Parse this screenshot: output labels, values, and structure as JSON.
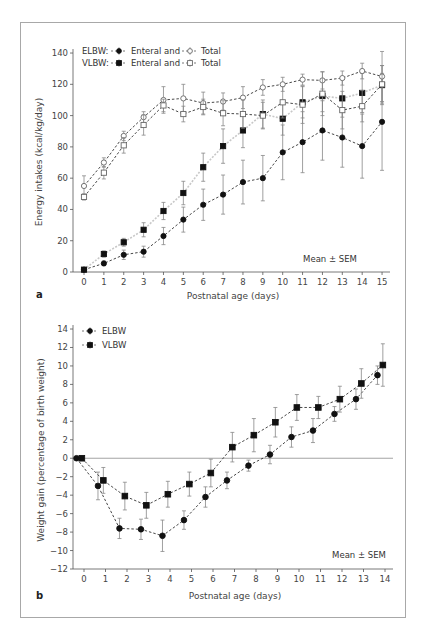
{
  "chart_data": [
    {
      "panel": "a",
      "type": "line",
      "title": "",
      "xlabel": "Postnatal age (days)",
      "ylabel": "Energy intakes (kcal/kg/day)",
      "x": [
        0,
        1,
        2,
        3,
        4,
        5,
        6,
        7,
        8,
        9,
        10,
        11,
        12,
        13,
        14,
        15
      ],
      "x_ticks": [
        "0",
        "1",
        "2",
        "3",
        "4",
        "5",
        "6",
        "7",
        "8",
        "9",
        "10",
        "11",
        "12",
        "13",
        "14",
        "15"
      ],
      "y_ticks": [
        "0",
        "20",
        "40",
        "60",
        "80",
        "100",
        "120",
        "140"
      ],
      "ylim": [
        0,
        140
      ],
      "grid": false,
      "annotation": "Mean ± SEM",
      "legend": {
        "position": "upper-left",
        "rows": [
          {
            "group": "ELBW:",
            "enteral": "Enteral and",
            "total": "Total"
          },
          {
            "group": "VLBW:",
            "enteral": "Enteral and",
            "total": "Total"
          }
        ]
      },
      "series": [
        {
          "name": "ELBW Enteral",
          "marker": "filled-circle",
          "values": [
            1.5,
            5.5,
            11,
            13,
            23,
            33.5,
            43,
            49.5,
            57.5,
            60,
            76.5,
            83,
            90.5,
            86,
            80.5,
            96
          ],
          "sem": [
            1,
            1.5,
            3,
            3.5,
            5.5,
            8,
            10,
            12.5,
            14,
            14.5,
            17.5,
            19.5,
            19,
            19,
            20.5,
            31
          ]
        },
        {
          "name": "VLBW Enteral",
          "marker": "filled-square",
          "values": [
            1.5,
            11.5,
            19,
            27,
            39,
            50.5,
            67,
            80.5,
            90.5,
            101,
            98,
            108.5,
            112.5,
            111,
            114.5,
            119.5
          ],
          "sem": [
            0.5,
            2,
            2.5,
            4.5,
            5.5,
            7.5,
            9,
            11,
            11,
            9,
            10.5,
            10,
            10,
            12,
            12.5,
            12.5
          ]
        },
        {
          "name": "ELBW Total",
          "marker": "open-circle",
          "values": [
            55,
            70,
            87,
            99,
            110,
            111,
            108,
            109,
            111.5,
            118,
            120,
            123,
            122.5,
            124,
            128.5,
            125
          ],
          "sem": [
            6.5,
            3,
            3,
            3.5,
            8.5,
            9,
            7,
            5.5,
            7,
            5,
            4.5,
            3.5,
            5.5,
            4.5,
            5,
            16
          ]
        },
        {
          "name": "VLBW Total",
          "marker": "open-square",
          "values": [
            48,
            63.5,
            81,
            94,
            106.5,
            101,
            105.5,
            101.5,
            101,
            100,
            108.5,
            107,
            114,
            103.5,
            106,
            120
          ],
          "sem": [
            2,
            4,
            5,
            6.5,
            4,
            5,
            5,
            8,
            9,
            8.5,
            10,
            12,
            14,
            12,
            10,
            12
          ]
        }
      ]
    },
    {
      "panel": "b",
      "type": "line",
      "title": "",
      "xlabel": "Postnatal age (days)",
      "ylabel": "Weight gain (percentage of birth weight)",
      "x": [
        0,
        1,
        2,
        3,
        4,
        5,
        6,
        7,
        8,
        9,
        10,
        11,
        12,
        13,
        14
      ],
      "x_ticks": [
        "0",
        "1",
        "2",
        "3",
        "4",
        "5",
        "6",
        "7",
        "8",
        "9",
        "10",
        "11",
        "12",
        "13",
        "14"
      ],
      "y_ticks": [
        "14",
        "12",
        "10",
        "8",
        "6",
        "4",
        "2",
        "0",
        "-2",
        "-4",
        "-6",
        "-8",
        "-10",
        "-12"
      ],
      "ylim": [
        -12,
        14
      ],
      "grid": false,
      "reference_line_y": 0,
      "annotation": "Mean ± SEM",
      "legend": {
        "position": "upper-left",
        "entries": [
          "ELBW",
          "VLBW"
        ]
      },
      "series": [
        {
          "name": "ELBW",
          "marker": "filled-circle",
          "x_offset": -0.35,
          "values": [
            0,
            -3,
            -7.6,
            -7.7,
            -8.4,
            -6.7,
            -4.2,
            -2.4,
            -0.8,
            0.4,
            2.3,
            3,
            4.8,
            6.4,
            9
          ],
          "sem": [
            0,
            1.5,
            1.1,
            1.1,
            1.7,
            1,
            1.1,
            0.9,
            0.6,
            1,
            1.1,
            1.3,
            0.8,
            1.1,
            1
          ]
        },
        {
          "name": "VLBW",
          "marker": "filled-square",
          "x_offset": -0.1,
          "values": [
            0,
            -2.4,
            -4.1,
            -5.1,
            -3.9,
            -2.8,
            -1.6,
            1.2,
            2.5,
            3.9,
            5.5,
            5.5,
            6.4,
            8.1,
            10.1
          ],
          "sem": [
            0,
            1.4,
            1.5,
            1.4,
            1.4,
            1.3,
            1.5,
            1.6,
            1.8,
            1.6,
            1.4,
            1.2,
            1.4,
            1.6,
            2.3
          ]
        }
      ]
    }
  ],
  "panels": {
    "a": {
      "label": "a",
      "ylabel": "Energy intakes (kcal/kg/day)",
      "xlabel": "Postnatal age (days)",
      "annotation": "Mean ± SEM",
      "legend_row1_group": "ELBW:",
      "legend_row2_group": "VLBW:",
      "legend_enteral": "Enteral and",
      "legend_total": "Total"
    },
    "b": {
      "label": "b",
      "ylabel": "Weight gain (percentage of birth weight)",
      "xlabel": "Postnatal age (days)",
      "annotation": "Mean ± SEM",
      "legend_elbw": "ELBW",
      "legend_vlbw": "VLBW"
    }
  },
  "colors": {
    "axis": "#555555",
    "marker": "#111111",
    "error_bar": "#888888",
    "dashed_line": "#333333",
    "vlbw_enteral_line": "#c8c8c8",
    "frame": "#a8a8a8"
  }
}
